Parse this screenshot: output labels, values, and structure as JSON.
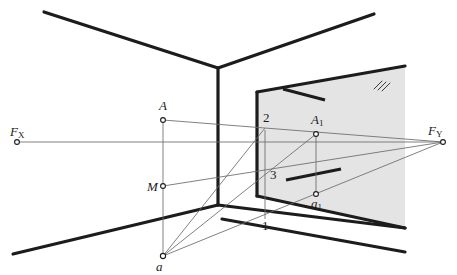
{
  "figure": {
    "background_color": "#ffffff",
    "line_color": "#1c1c1c",
    "thin_line_color": "#5a5a5a",
    "plane_fill_color": "#e2e2e2",
    "plane_edge_color": "#1c1c1c",
    "width": 457,
    "height": 275
  },
  "labels": {
    "fx": "F",
    "fx_sub": "X",
    "fy": "F",
    "fy_sub": "Y",
    "a_upper": "A",
    "m": "M",
    "a_lower": "a",
    "a1": "A",
    "a1_sub": "1",
    "a1_lower": "a",
    "a1_lower_sub": "1",
    "one": "1",
    "two": "2",
    "three": "3"
  },
  "points": {
    "FX": {
      "name": "FX",
      "x": 17,
      "y": 142,
      "label": "F_X"
    },
    "FY": {
      "name": "FY",
      "x": 443,
      "y": 142,
      "label": "F_Y"
    },
    "A": {
      "name": "A",
      "x": 163,
      "y": 120,
      "label": "A"
    },
    "M": {
      "name": "M",
      "x": 163,
      "y": 186,
      "label": "M"
    },
    "a": {
      "name": "a",
      "x": 163,
      "y": 256,
      "label": "a"
    },
    "A1": {
      "name": "A1",
      "x": 316,
      "y": 134,
      "label": "A1"
    },
    "a1": {
      "name": "a1",
      "x": 316,
      "y": 194,
      "label": "a1"
    },
    "p1": {
      "name": "1",
      "x": 265,
      "y": 216,
      "label": "1"
    },
    "p2": {
      "name": "2",
      "x": 265,
      "y": 133,
      "label": "2"
    },
    "p3": {
      "name": "3",
      "x": 265,
      "y": 173,
      "label": "3"
    }
  },
  "geometry": {
    "room": {
      "ceiling_left": [
        44,
        12,
        218,
        68
      ],
      "ceiling_right": [
        218,
        68,
        374,
        14
      ],
      "corner_vertical": [
        218,
        68,
        218,
        205
      ],
      "floor_left": [
        13,
        254,
        218,
        205
      ],
      "floor_right": [
        218,
        205,
        405,
        228
      ],
      "floor_right_lower": [
        218,
        218,
        405,
        252
      ],
      "floor_left_lower": [
        13,
        267,
        218,
        218
      ]
    },
    "picture_plane": {
      "polygon": "257,92 405,66 405,228 257,196",
      "left_edge": [
        257,
        92,
        257,
        196
      ],
      "top_edge": [
        257,
        92,
        405,
        66
      ],
      "bottom_edge": [
        257,
        196,
        405,
        228
      ],
      "hatch_mark": {
        "x": 378,
        "y": 84
      }
    },
    "thick_ticks": {
      "upper": [
        283,
        90,
        325,
        100
      ],
      "lower": [
        286,
        179,
        340,
        169
      ]
    },
    "rays": [
      {
        "name": "FX-FY-horizon",
        "from": [
          17,
          142
        ],
        "to": [
          443,
          142
        ]
      },
      {
        "name": "A-to-FY",
        "from": [
          163,
          120
        ],
        "to": [
          443,
          142
        ]
      },
      {
        "name": "M-to-FY",
        "from": [
          163,
          186
        ],
        "to": [
          443,
          142
        ]
      },
      {
        "name": "a-to-FY",
        "from": [
          163,
          256
        ],
        "to": [
          443,
          142
        ]
      },
      {
        "name": "a-to-A1",
        "from": [
          163,
          256
        ],
        "to": [
          316,
          134
        ]
      },
      {
        "name": "a-to-p2",
        "from": [
          163,
          256
        ],
        "to": [
          265,
          133
        ]
      },
      {
        "name": "A1-vertical-to-a1",
        "from": [
          316,
          134
        ],
        "to": [
          316,
          194
        ]
      },
      {
        "name": "A-vertical-to-a",
        "from": [
          163,
          120
        ],
        "to": [
          163,
          256
        ]
      },
      {
        "name": "p2-vertical-to-p1",
        "from": [
          265,
          133
        ],
        "to": [
          265,
          216
        ]
      },
      {
        "name": "A1-to-FY",
        "from": [
          316,
          134
        ],
        "to": [
          443,
          142
        ]
      },
      {
        "name": "a1-to-FY",
        "from": [
          316,
          194
        ],
        "to": [
          443,
          142
        ]
      }
    ]
  }
}
